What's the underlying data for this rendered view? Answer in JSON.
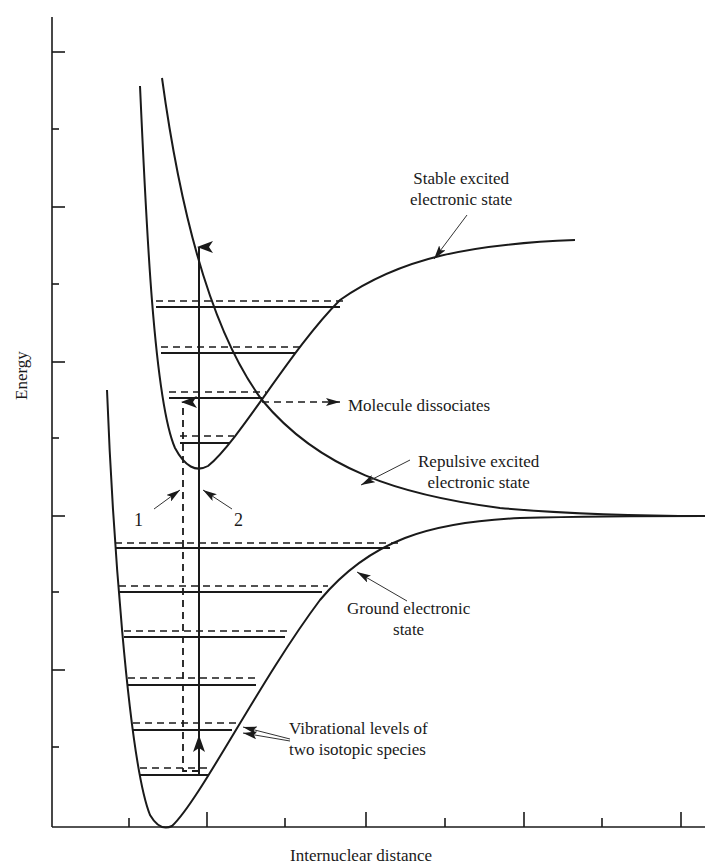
{
  "diagram": {
    "type": "potential-energy-curves",
    "axes": {
      "ylabel": "Energy",
      "xlabel": "Internuclear distance",
      "y_ticks_px": [
        52,
        129,
        207,
        284,
        362,
        438,
        516,
        592,
        670,
        747
      ],
      "x_ticks_px": [
        129,
        207,
        285,
        366,
        445,
        524,
        602,
        681
      ]
    },
    "labels": {
      "stable_excited": [
        "Stable excited",
        "electronic state"
      ],
      "molecule_dissociates": "Molecule dissociates",
      "repulsive_excited": [
        "Repulsive excited",
        "electronic state"
      ],
      "ground_state": [
        "Ground electronic",
        "state"
      ],
      "vibrational_levels": [
        "Vibrational levels of",
        "two isotopic species"
      ],
      "transition_1": "1",
      "transition_2": "2"
    },
    "curves": [
      {
        "name": "Ground electronic state",
        "style": "solid"
      },
      {
        "name": "Stable excited electronic state",
        "style": "solid"
      },
      {
        "name": "Repulsive excited electronic state",
        "style": "solid"
      }
    ],
    "vibrational_levels": {
      "ground_solid_y": [
        775,
        730,
        685,
        637,
        592,
        548
      ],
      "ground_dashed_y": [
        768,
        723,
        678,
        631,
        586,
        543
      ],
      "excited_solid_y": [
        443,
        398,
        353,
        307
      ],
      "excited_dashed_y": [
        436,
        392,
        347,
        301
      ]
    },
    "colors": {
      "line": "#1a1a1a",
      "background": "#ffffff"
    }
  }
}
